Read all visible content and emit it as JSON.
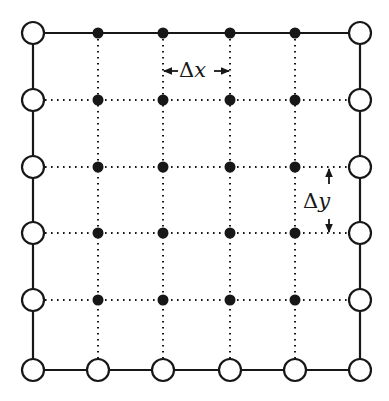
{
  "figure": {
    "type": "diagram",
    "width": 389,
    "height": 401,
    "background_color": "#ffffff",
    "stroke_color": "#171717"
  },
  "grid": {
    "columns": 6,
    "rows": 6,
    "x_positions": [
      33,
      98,
      163,
      230,
      295,
      360
    ],
    "y_positions": [
      33,
      100,
      167,
      233,
      300,
      370
    ],
    "boundary_node_marker": "open-circle",
    "interior_node_marker": "filled-circle",
    "boundary_node_radius": 11,
    "interior_node_radius": 5.5,
    "boundary_line_style": "solid",
    "interior_line_style": "dotted",
    "boundary_line_width": 2.2,
    "interior_line_width": 2.0,
    "interior_dash_pattern": "1.6 4.4"
  },
  "annotations": {
    "dx": {
      "symbol_delta": "Δ",
      "symbol_variable": "x",
      "text": "Δx",
      "arrow_type": "double-headed-horizontal",
      "arrow_y": 71,
      "arrow_x_start": 163,
      "arrow_x_end": 230,
      "meaning": "horizontal grid spacing"
    },
    "dy": {
      "symbol_delta": "Δ",
      "symbol_variable": "y",
      "text": "Δy",
      "arrow_type": "double-headed-vertical",
      "arrow_x": 329,
      "arrow_y_start": 168,
      "arrow_y_end": 234,
      "meaning": "vertical grid spacing"
    }
  }
}
